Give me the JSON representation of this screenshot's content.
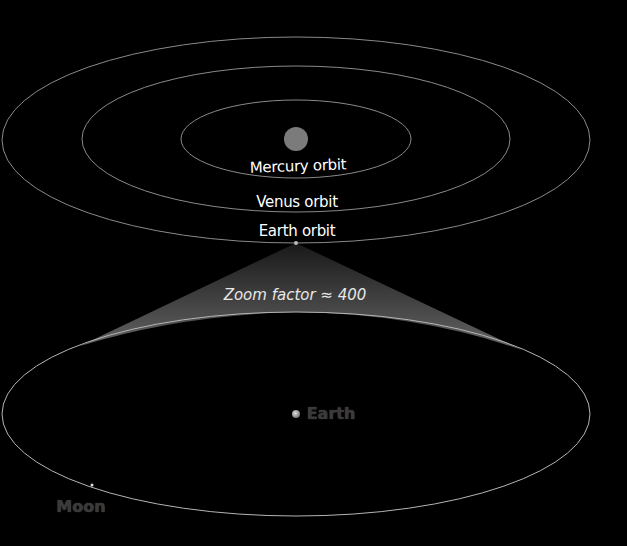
{
  "diagram": {
    "upper_panel": {
      "sun": {
        "name": "Sun",
        "color": "#7b7b7b"
      },
      "orbits": [
        {
          "id": "mercury",
          "label": "Mercury orbit"
        },
        {
          "id": "venus",
          "label": "Venus orbit"
        },
        {
          "id": "earth",
          "label": "Earth orbit"
        }
      ]
    },
    "zoom": {
      "label": "Zoom factor ≈ 400"
    },
    "lower_panel": {
      "earth_label": "Earth",
      "moon_label": "Moon"
    },
    "colors": {
      "background": "#000000",
      "orbit_line": "#9a9a9a",
      "cone_fill": "#5e5e5e",
      "text_primary": "#ffffff",
      "text_dim": "#3a3a3a"
    }
  }
}
